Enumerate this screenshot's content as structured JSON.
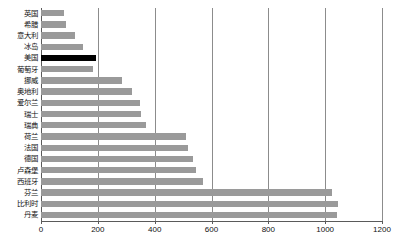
{
  "chart_data": {
    "type": "bar",
    "orientation": "horizontal",
    "title": "",
    "subtitle": "",
    "xlabel": "",
    "ylabel": "",
    "xlim": [
      0,
      1200
    ],
    "ylim": null,
    "grid": true,
    "legend": null,
    "xticks": [
      0,
      200,
      400,
      600,
      800,
      1000,
      1200
    ],
    "xtick_labels": [
      "0",
      "200",
      "400",
      "600",
      "800",
      "1000",
      "1200"
    ],
    "highlight_category": "美国",
    "colors": {
      "bar": "#9a9a9a",
      "highlight_bar": "#000000",
      "gridline": "#8c8c8c",
      "axis": "#5a5a5a",
      "background": "#ffffff",
      "text": "#111111"
    },
    "categories": [
      "英国",
      "希腊",
      "意大利",
      "冰岛",
      "美国",
      "葡萄牙",
      "挪威",
      "奥地利",
      "爱尔兰",
      "瑞士",
      "瑞典",
      "荷兰",
      "法国",
      "德国",
      "卢森堡",
      "西班牙",
      "芬兰",
      "比利时",
      "丹麦"
    ],
    "values": [
      81,
      88,
      120,
      148,
      194,
      183,
      285,
      320,
      349,
      352,
      370,
      511,
      518,
      535,
      546,
      570,
      1025,
      1045,
      1042
    ]
  }
}
